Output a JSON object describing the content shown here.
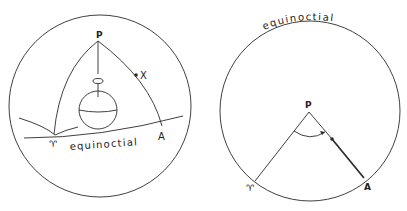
{
  "figures": [
    {
      "id": "celestial-sphere",
      "labels": {
        "pole": "P",
        "star": "X",
        "first_point_of_aries": "♈",
        "point_a": "A",
        "equinoctial": "equinoctial"
      },
      "elements": [
        "outer-sphere",
        "earth-globe",
        "rotation-arrow",
        "ecliptic-arc",
        "equinoctial-arc",
        "meridian-P-aries",
        "meridian-P-A",
        "polar-axis"
      ]
    },
    {
      "id": "polar-projection",
      "labels": {
        "pole": "P",
        "first_point_of_aries": "♈",
        "point_a": "A",
        "equinoctial": "equinoctial"
      },
      "elements": [
        "equinoctial-circle",
        "line-P-aries",
        "line-P-A",
        "angle-arc",
        "star-dot"
      ]
    }
  ],
  "colors": {
    "ink": "#2a2a2a",
    "background": "#ffffff"
  }
}
